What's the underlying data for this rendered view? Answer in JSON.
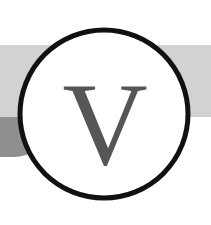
{
  "logo": {
    "name": "circular-letter-badge",
    "monogram": "V",
    "monogram_color": "#565656",
    "circle": {
      "fill": "#ffffff",
      "stroke_color": "#111111",
      "stroke_width": 5,
      "center_x": 104,
      "center_y": 114,
      "radius": 84
    },
    "bands": [
      {
        "name": "light-gray-band",
        "color": "#d2d2d2",
        "x": 0,
        "y": 45,
        "width": 211,
        "height": 72
      },
      {
        "name": "dark-gray-block",
        "color": "#8f8f8f",
        "x": 0,
        "y": 117,
        "width": 52,
        "height": 40
      }
    ],
    "canvas": {
      "width": 211,
      "height": 225,
      "background": "#ffffff"
    }
  }
}
